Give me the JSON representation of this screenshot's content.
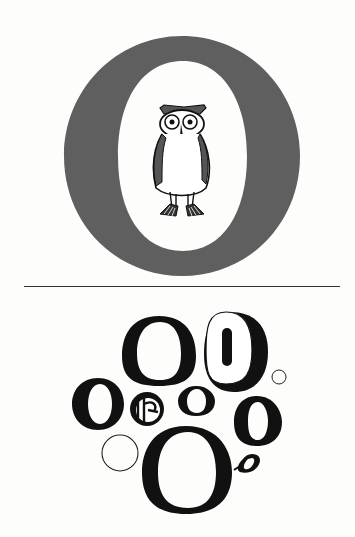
{
  "page": {
    "background": "#fdfdfb"
  },
  "top_panel": {
    "big_letter": "O",
    "big_letter_color": "#5f5f5f",
    "illustration": "owl-icon"
  },
  "divider": {
    "color": "#333333"
  },
  "bottom_panel": {
    "letters": [
      {
        "glyph": "O",
        "style": "serif-large"
      },
      {
        "glyph": "0",
        "style": "slab-shadowed"
      },
      {
        "glyph": "O",
        "style": "condensed-bold"
      },
      {
        "glyph": "O",
        "style": "gothic"
      },
      {
        "glyph": "o",
        "style": "serif-small"
      },
      {
        "glyph": "O",
        "style": "bold-serif"
      },
      {
        "glyph": "O",
        "style": "serif-huge"
      },
      {
        "glyph": "o",
        "style": "italic-small"
      },
      {
        "glyph": "○",
        "style": "outline-circle-small"
      },
      {
        "glyph": "○",
        "style": "outline-circle-large"
      }
    ]
  }
}
